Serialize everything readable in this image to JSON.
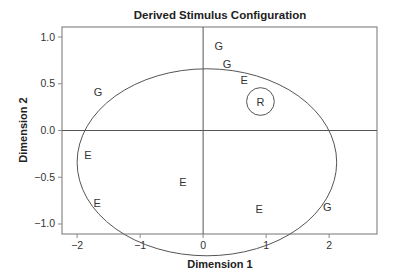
{
  "chart_data": {
    "type": "scatter",
    "title": "Derived Stimulus Configuration",
    "xlabel": "Dimension 1",
    "ylabel": "Dimension 2",
    "xlim": [
      -2.24,
      2.76
    ],
    "ylim": [
      -1.107,
      1.107
    ],
    "xticks": [
      -2,
      -1,
      0,
      1,
      2
    ],
    "xtick_labels": [
      "−2",
      "−1",
      "0",
      "1",
      "2"
    ],
    "yticks": [
      1.0,
      0.5,
      0.0,
      -0.5,
      -1.0
    ],
    "ytick_labels": [
      "1.0",
      "0.5",
      "0.0",
      "−0.5",
      "−1.0"
    ],
    "grid": false,
    "reference_lines": {
      "x": 0,
      "y": 0
    },
    "points": [
      {
        "label": "G",
        "x": 0.25,
        "y": 0.9
      },
      {
        "label": "G",
        "x": 0.38,
        "y": 0.71
      },
      {
        "label": "E",
        "x": 0.65,
        "y": 0.54
      },
      {
        "label": "R",
        "x": 0.91,
        "y": 0.31,
        "circled": true
      },
      {
        "label": "G",
        "x": -1.67,
        "y": 0.41
      },
      {
        "label": "E",
        "x": -1.83,
        "y": -0.26
      },
      {
        "label": "E",
        "x": -0.32,
        "y": -0.55
      },
      {
        "label": "E",
        "x": -1.68,
        "y": -0.78
      },
      {
        "label": "E",
        "x": 0.89,
        "y": -0.84
      },
      {
        "label": "G",
        "x": 1.97,
        "y": -0.82
      }
    ],
    "ellipse": {
      "cx": 0.06,
      "cy": -0.34,
      "rx": 2.06,
      "ry": 1.0
    },
    "r_circle_radius": 0.22,
    "colors": {
      "line": "#555555",
      "frame": "#8a8a8a",
      "text": "#333333"
    }
  }
}
